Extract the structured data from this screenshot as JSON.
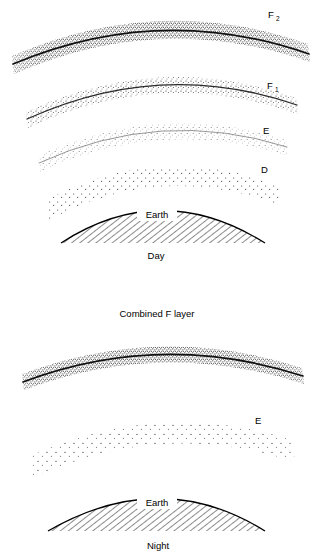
{
  "figure": {
    "title_implicit": "Ionospheric layers by day and night",
    "panels": [
      {
        "id": "day",
        "caption": "Day",
        "earth_label": "Earth",
        "layers": [
          {
            "id": "f2",
            "label": "F",
            "subscript": "2",
            "label_full": "F2",
            "density": "dense-stipple-with-dark-core"
          },
          {
            "id": "f1",
            "label": "F",
            "subscript": "1",
            "label_full": "F1",
            "density": "medium-stipple-with-dark-core"
          },
          {
            "id": "e",
            "label": "E",
            "subscript": "",
            "label_full": "E",
            "density": "light-stipple"
          },
          {
            "id": "d",
            "label": "D",
            "subscript": "",
            "label_full": "D",
            "density": "sparse-dots"
          }
        ]
      },
      {
        "id": "night",
        "caption": "Night",
        "earth_label": "Earth",
        "top_label": "Combined F layer",
        "layers": [
          {
            "id": "combined-f",
            "label": "Combined F layer",
            "subscript": "",
            "label_full": "Combined F layer",
            "density": "dense-stipple-with-dark-core"
          },
          {
            "id": "e",
            "label": "E",
            "subscript": "",
            "label_full": "E",
            "density": "sparse-dots"
          }
        ]
      }
    ]
  },
  "colors": {
    "ink": "#000000",
    "background": "#ffffff",
    "stipple_dark": "#1a1a1a",
    "stipple_mid": "#555555",
    "stipple_light": "#888888",
    "hatch": "#000000"
  },
  "labels": {
    "day_f2": "F",
    "day_f2_sub": "2",
    "day_f1": "F",
    "day_f1_sub": "1",
    "day_e": "E",
    "day_d": "D",
    "day_earth": "Earth",
    "day_caption": "Day",
    "night_combined_f": "Combined F layer",
    "night_e": "E",
    "night_earth": "Earth",
    "night_caption": "Night"
  }
}
